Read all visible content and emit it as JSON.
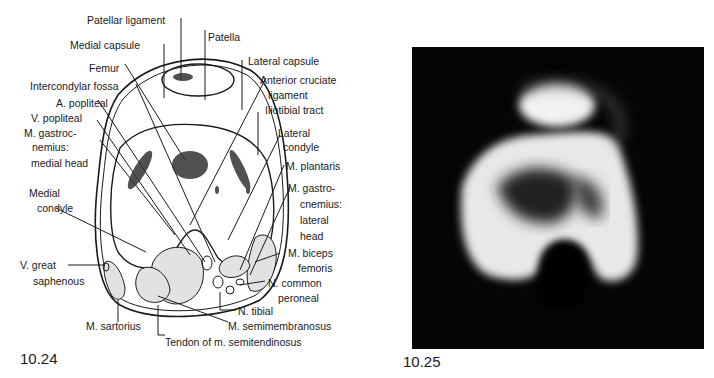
{
  "figure_left": {
    "number": "10.24",
    "labels": {
      "patellar_ligament": "Patellar ligament",
      "patella": "Patella",
      "medial_capsule": "Medial capsule",
      "lateral_capsule": "Lateral capsule",
      "femur": "Femur",
      "anterior_cruciate_1": "Anterior cruciate",
      "anterior_cruciate_2": "ligament",
      "intercondylar_fossa": "Intercondylar fossa",
      "a_popliteal": "A. popliteal",
      "iliotibial_tract": "Iliotibial tract",
      "v_popliteal": "V. popliteal",
      "lateral_condyle_1": "Lateral",
      "lateral_condyle_2": "condyle",
      "gastroc_medial_1": "M. gastroc-",
      "gastroc_medial_2": "nemius:",
      "gastroc_medial_3": "medial head",
      "m_plantaris": "M. plantaris",
      "medial_condyle_1": "Medial",
      "medial_condyle_2": "condyle",
      "gastro_lateral_1": "M. gastro-",
      "gastro_lateral_2": "cnemius:",
      "gastro_lateral_3": "lateral",
      "gastro_lateral_4": "head",
      "biceps_1": "M. biceps",
      "biceps_2": "femoris",
      "v_great_1": "V. great",
      "v_great_2": "saphenous",
      "n_common_1": "N. common",
      "n_common_2": "peroneal",
      "n_tibial": "N. tibial",
      "m_sartorius": "M. sartorius",
      "m_semimembranosus": "M. semimembranosus",
      "tendon_semitendinosus": "Tendon of m. semitendinosus"
    }
  },
  "figure_right": {
    "number": "10.25"
  }
}
